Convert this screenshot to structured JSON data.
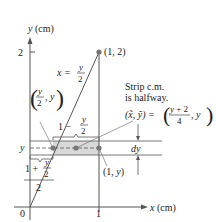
{
  "figure": {
    "axes": {
      "y_label": "y (cm)",
      "x_label": "x (cm)",
      "origin_label": "0",
      "x_tick_label": "1",
      "y_tick_label": "2"
    },
    "curve": {
      "equation_lhs": "x =",
      "equation_num": "y",
      "equation_den": "2"
    },
    "points": {
      "top_vertex": "(1, 2)",
      "right_point": "(1, y)",
      "left_point_num": "y",
      "left_point_den": "2",
      "left_point_tail": ", y"
    },
    "strip": {
      "y_label": "y",
      "dy_label": "dy",
      "length_prefix": "1 −",
      "length_num": "y",
      "length_den": "2",
      "midpoint_num_prefix": "1 +",
      "midpoint_num_num": "y",
      "midpoint_num_den": "2",
      "midpoint_den": "2"
    },
    "annotation": {
      "line1": "Strip c.m.",
      "line2": "is halfway.",
      "centroid_lhs": "(x̃, ỹ) =",
      "centroid_num": "y + 2",
      "centroid_den": "4",
      "centroid_tail": ", y"
    },
    "colors": {
      "line": "#555555",
      "point": "#777777",
      "strip_fill": "#d9d9d9",
      "text": "#222222"
    }
  }
}
